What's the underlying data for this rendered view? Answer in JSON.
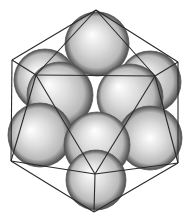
{
  "figure": {
    "width": 190,
    "height": 223,
    "colors": {
      "background": "#ffffff",
      "edge": "#2a2a2a",
      "sphere_highlight": "#ffffff",
      "sphere_mid": "#b9b9b9",
      "sphere_shadow": "#4a4a4a"
    },
    "spheres": [
      {
        "id": "top",
        "cx": 97,
        "cy": 44,
        "r": 32,
        "hx": 92,
        "hy": 34
      },
      {
        "id": "upper-left-back",
        "cx": 45,
        "cy": 80,
        "r": 31,
        "hx": 36,
        "hy": 72
      },
      {
        "id": "upper-right-back",
        "cx": 150,
        "cy": 82,
        "r": 31,
        "hx": 140,
        "hy": 74
      },
      {
        "id": "upper-left-front",
        "cx": 60,
        "cy": 95,
        "r": 33,
        "hx": 48,
        "hy": 84
      },
      {
        "id": "upper-right-front",
        "cx": 130,
        "cy": 97,
        "r": 33,
        "hx": 118,
        "hy": 86
      },
      {
        "id": "middle-left",
        "cx": 40,
        "cy": 135,
        "r": 32,
        "hx": 30,
        "hy": 130
      },
      {
        "id": "middle-right",
        "cx": 150,
        "cy": 138,
        "r": 32,
        "hx": 150,
        "hy": 138
      },
      {
        "id": "center",
        "cx": 97,
        "cy": 145,
        "r": 33,
        "hx": 95,
        "hy": 130
      },
      {
        "id": "bottom",
        "cx": 96,
        "cy": 180,
        "r": 30,
        "hx": 90,
        "hy": 172
      }
    ],
    "outline_vertices": [
      [
        96,
        10
      ],
      [
        178,
        62
      ],
      [
        178,
        163
      ],
      [
        94,
        212
      ],
      [
        11,
        161
      ],
      [
        12,
        60
      ]
    ],
    "front_vertices": {
      "upper_left": [
        36,
        75
      ],
      "upper_right": [
        155,
        76
      ],
      "bottom": [
        95,
        174
      ]
    },
    "edges": [
      [
        [
          96,
          10
        ],
        [
          178,
          62
        ]
      ],
      [
        [
          178,
          62
        ],
        [
          178,
          163
        ]
      ],
      [
        [
          178,
          163
        ],
        [
          94,
          212
        ]
      ],
      [
        [
          94,
          212
        ],
        [
          11,
          161
        ]
      ],
      [
        [
          11,
          161
        ],
        [
          12,
          60
        ]
      ],
      [
        [
          12,
          60
        ],
        [
          96,
          10
        ]
      ],
      [
        [
          36,
          75
        ],
        [
          155,
          76
        ]
      ],
      [
        [
          36,
          75
        ],
        [
          12,
          60
        ]
      ],
      [
        [
          155,
          76
        ],
        [
          178,
          62
        ]
      ],
      [
        [
          95,
          174
        ],
        [
          94,
          212
        ]
      ],
      [
        [
          36,
          75
        ],
        [
          95,
          174
        ]
      ],
      [
        [
          155,
          76
        ],
        [
          95,
          174
        ]
      ],
      [
        [
          36,
          75
        ],
        [
          96,
          10
        ]
      ],
      [
        [
          155,
          76
        ],
        [
          96,
          10
        ]
      ],
      [
        [
          36,
          75
        ],
        [
          11,
          161
        ]
      ],
      [
        [
          155,
          76
        ],
        [
          178,
          163
        ]
      ],
      [
        [
          95,
          174
        ],
        [
          11,
          161
        ]
      ],
      [
        [
          95,
          174
        ],
        [
          178,
          163
        ]
      ]
    ]
  }
}
